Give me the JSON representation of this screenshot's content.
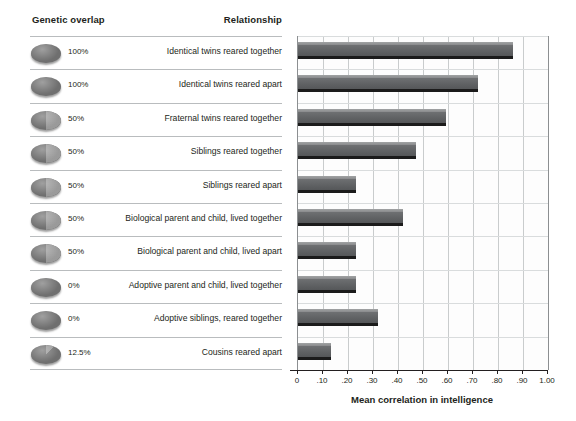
{
  "headers": {
    "genetic_overlap": "Genetic overlap",
    "relationship": "Relationship"
  },
  "axis": {
    "xlabel": "Mean correlation in intelligence",
    "ticks": [
      "0",
      ".10",
      ".20",
      ".30",
      ".40",
      ".50",
      ".60",
      ".70",
      ".80",
      ".90",
      "1.00"
    ]
  },
  "rows": [
    {
      "pct": "100%",
      "overlap": 100,
      "label": "Identical twins reared together",
      "value": 0.86
    },
    {
      "pct": "100%",
      "overlap": 100,
      "label": "Identical twins reared apart",
      "value": 0.72
    },
    {
      "pct": "50%",
      "overlap": 50,
      "label": "Fraternal twins reared together",
      "value": 0.59
    },
    {
      "pct": "50%",
      "overlap": 50,
      "label": "Siblings reared together",
      "value": 0.47
    },
    {
      "pct": "50%",
      "overlap": 50,
      "label": "Siblings reared apart",
      "value": 0.23
    },
    {
      "pct": "50%",
      "overlap": 50,
      "label": "Biological parent and child, lived together",
      "value": 0.42
    },
    {
      "pct": "50%",
      "overlap": 50,
      "label": "Biological parent and child, lived apart",
      "value": 0.23
    },
    {
      "pct": "0%",
      "overlap": 0,
      "label": "Adoptive parent and child, lived together",
      "value": 0.23
    },
    {
      "pct": "0%",
      "overlap": 0,
      "label": "Adoptive siblings, reared together",
      "value": 0.32
    },
    {
      "pct": "12.5%",
      "overlap": 12.5,
      "label": "Cousins reared apart",
      "value": 0.13
    }
  ],
  "chart_data": {
    "type": "bar",
    "orientation": "horizontal",
    "title": "",
    "xlabel": "Mean correlation in intelligence",
    "ylabel": "Relationship",
    "xlim": [
      0,
      1.0
    ],
    "xticks": [
      0,
      0.1,
      0.2,
      0.3,
      0.4,
      0.5,
      0.6,
      0.7,
      0.8,
      0.9,
      1.0
    ],
    "xticklabels": [
      "0",
      ".10",
      ".20",
      ".30",
      ".40",
      ".50",
      ".60",
      ".70",
      ".80",
      ".90",
      "1.00"
    ],
    "grid": true,
    "legend": null,
    "categories": [
      "Identical twins reared together",
      "Identical twins reared apart",
      "Fraternal twins reared together",
      "Siblings reared together",
      "Siblings reared apart",
      "Biological parent and child, lived together",
      "Biological parent and child, lived apart",
      "Adoptive parent and child, lived together",
      "Adoptive siblings, reared together",
      "Cousins reared apart"
    ],
    "values": [
      0.86,
      0.72,
      0.59,
      0.47,
      0.23,
      0.42,
      0.23,
      0.23,
      0.32,
      0.13
    ],
    "genetic_overlap_percent": [
      100,
      100,
      50,
      50,
      50,
      50,
      50,
      0,
      0,
      12.5
    ],
    "bar_color": "#6e7072"
  },
  "colors": {
    "bar": "#6e7072",
    "bar_shadow": "#1b1b1b",
    "text": "#231f20",
    "rule": "#b9bcbe",
    "gridline": "#c9cccd",
    "pie_dark": "#6f6f6f",
    "pie_light": "#9e9e9e"
  }
}
